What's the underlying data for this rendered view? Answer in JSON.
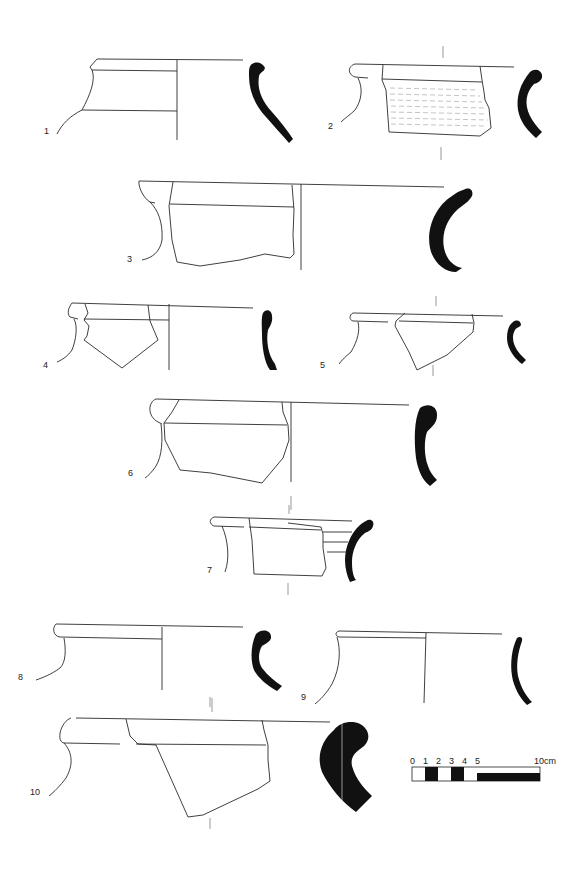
{
  "plate": {
    "type": "pottery rim sherd drawings",
    "sherds": [
      {
        "id": 1,
        "label": "1"
      },
      {
        "id": 2,
        "label": "2"
      },
      {
        "id": 3,
        "label": "3"
      },
      {
        "id": 4,
        "label": "4"
      },
      {
        "id": 5,
        "label": "5"
      },
      {
        "id": 6,
        "label": "6"
      },
      {
        "id": 7,
        "label": "7"
      },
      {
        "id": 8,
        "label": "8"
      },
      {
        "id": 9,
        "label": "9"
      },
      {
        "id": 10,
        "label": "10"
      }
    ],
    "scale_bar": {
      "ticks": [
        "0",
        "1",
        "2",
        "3",
        "4",
        "5",
        "10cm"
      ],
      "fill_color": "#111111"
    },
    "colors": {
      "line": "#2a2a2a",
      "section_fill": "#111111",
      "background": "#ffffff"
    }
  }
}
